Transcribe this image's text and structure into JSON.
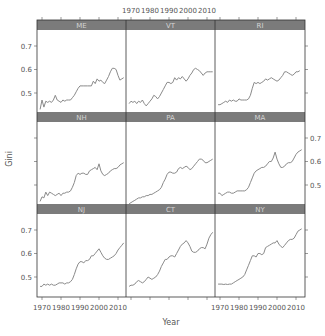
{
  "chart_data": {
    "type": "line",
    "layout": "trellis 3x3",
    "title": "",
    "xlabel": "Year",
    "ylabel": "Gini",
    "xlim": [
      1967,
      2014
    ],
    "ylim": [
      0.415,
      0.765
    ],
    "x_ticks": [
      1970,
      1980,
      1990,
      2000,
      2010
    ],
    "y_ticks": [
      0.5,
      0.6,
      0.7
    ],
    "grid": false,
    "legend": null,
    "colors": {
      "strip_bg": "#7b7b7b",
      "strip_text": "#d4d4d4",
      "line": "#8a8a8a",
      "frame": "#333333",
      "axis_text": "#555555"
    },
    "panels": [
      {
        "name": "ME",
        "row": 0,
        "col": 0,
        "x": [
          1969,
          1970,
          1971,
          1972,
          1973,
          1974,
          1975,
          1976,
          1977,
          1978,
          1979,
          1980,
          1981,
          1982,
          1983,
          1984,
          1985,
          1986,
          1987,
          1988,
          1989,
          1990,
          1992,
          1994,
          1996,
          1997,
          1998,
          1999,
          2000,
          2001,
          2002,
          2003,
          2004,
          2005,
          2006,
          2007,
          2008,
          2009,
          2010,
          2011,
          2012,
          2013
        ],
        "y": [
          0.43,
          0.47,
          0.44,
          0.465,
          0.46,
          0.465,
          0.46,
          0.47,
          0.49,
          0.47,
          0.465,
          0.46,
          0.47,
          0.465,
          0.47,
          0.47,
          0.47,
          0.48,
          0.49,
          0.505,
          0.52,
          0.53,
          0.53,
          0.53,
          0.53,
          0.55,
          0.54,
          0.56,
          0.55,
          0.555,
          0.545,
          0.54,
          0.555,
          0.57,
          0.59,
          0.605,
          0.605,
          0.6,
          0.575,
          0.555,
          0.56,
          0.565
        ]
      },
      {
        "name": "VT",
        "row": 0,
        "col": 1,
        "x": [
          1969,
          1970,
          1971,
          1972,
          1973,
          1974,
          1975,
          1976,
          1977,
          1978,
          1979,
          1980,
          1981,
          1982,
          1983,
          1984,
          1985,
          1986,
          1987,
          1988,
          1989,
          1990,
          1991,
          1992,
          1993,
          1994,
          1995,
          1996,
          1997,
          1998,
          1999,
          2000,
          2001,
          2002,
          2003,
          2004,
          2005,
          2006,
          2007,
          2008,
          2009,
          2010,
          2011,
          2012,
          2013
        ],
        "y": [
          0.455,
          0.465,
          0.46,
          0.465,
          0.455,
          0.465,
          0.46,
          0.47,
          0.455,
          0.445,
          0.455,
          0.465,
          0.475,
          0.49,
          0.485,
          0.475,
          0.485,
          0.5,
          0.515,
          0.53,
          0.545,
          0.545,
          0.54,
          0.545,
          0.565,
          0.555,
          0.565,
          0.56,
          0.57,
          0.56,
          0.55,
          0.56,
          0.575,
          0.585,
          0.6,
          0.605,
          0.6,
          0.595,
          0.585,
          0.575,
          0.585,
          0.59,
          0.59,
          0.59,
          0.59
        ]
      },
      {
        "name": "RI",
        "row": 0,
        "col": 2,
        "x": [
          1969,
          1970,
          1971,
          1972,
          1973,
          1974,
          1975,
          1976,
          1977,
          1978,
          1979,
          1980,
          1981,
          1982,
          1983,
          1984,
          1985,
          1986,
          1987,
          1988,
          1989,
          1990,
          1991,
          1992,
          1993,
          1994,
          1995,
          1996,
          1997,
          1998,
          1999,
          2000,
          2001,
          2002,
          2003,
          2004,
          2005,
          2006,
          2007,
          2008,
          2009,
          2010,
          2011,
          2012
        ],
        "y": [
          0.45,
          0.45,
          0.455,
          0.46,
          0.465,
          0.46,
          0.47,
          0.465,
          0.47,
          0.465,
          0.465,
          0.475,
          0.47,
          0.47,
          0.47,
          0.47,
          0.475,
          0.49,
          0.52,
          0.545,
          0.54,
          0.545,
          0.54,
          0.545,
          0.55,
          0.56,
          0.555,
          0.56,
          0.565,
          0.56,
          0.555,
          0.55,
          0.555,
          0.565,
          0.575,
          0.59,
          0.59,
          0.585,
          0.58,
          0.575,
          0.58,
          0.59,
          0.59,
          0.595
        ]
      },
      {
        "name": "NH",
        "row": 1,
        "col": 0,
        "x": [
          1969,
          1970,
          1971,
          1972,
          1973,
          1974,
          1975,
          1976,
          1977,
          1978,
          1979,
          1980,
          1981,
          1982,
          1983,
          1984,
          1985,
          1986,
          1987,
          1988,
          1989,
          1990,
          1991,
          1992,
          1993,
          1994,
          1995,
          1996,
          1997,
          1998,
          1999,
          2000,
          2001,
          2002,
          2003,
          2004,
          2005,
          2006,
          2007,
          2008,
          2009,
          2010,
          2011,
          2012,
          2013
        ],
        "y": [
          0.43,
          0.45,
          0.445,
          0.47,
          0.455,
          0.47,
          0.465,
          0.46,
          0.455,
          0.46,
          0.465,
          0.455,
          0.465,
          0.465,
          0.47,
          0.47,
          0.475,
          0.49,
          0.51,
          0.54,
          0.55,
          0.545,
          0.55,
          0.55,
          0.545,
          0.545,
          0.56,
          0.565,
          0.57,
          0.575,
          0.565,
          0.59,
          0.56,
          0.545,
          0.54,
          0.545,
          0.55,
          0.56,
          0.565,
          0.57,
          0.57,
          0.575,
          0.585,
          0.59,
          0.595
        ]
      },
      {
        "name": "PA",
        "row": 1,
        "col": 1,
        "x": [
          1969,
          1970,
          1971,
          1972,
          1973,
          1974,
          1975,
          1976,
          1977,
          1978,
          1979,
          1980,
          1981,
          1982,
          1983,
          1984,
          1985,
          1986,
          1987,
          1988,
          1989,
          1990,
          1991,
          1992,
          1993,
          1994,
          1995,
          1996,
          1997,
          1998,
          1999,
          2000,
          2001,
          2002,
          2003,
          2004,
          2005,
          2006,
          2007,
          2008,
          2009,
          2010,
          2011,
          2012,
          2013
        ],
        "y": [
          0.42,
          0.425,
          0.43,
          0.435,
          0.44,
          0.445,
          0.445,
          0.45,
          0.45,
          0.455,
          0.455,
          0.46,
          0.46,
          0.465,
          0.47,
          0.475,
          0.48,
          0.49,
          0.51,
          0.525,
          0.545,
          0.555,
          0.555,
          0.55,
          0.55,
          0.555,
          0.57,
          0.575,
          0.57,
          0.575,
          0.58,
          0.575,
          0.565,
          0.57,
          0.58,
          0.59,
          0.6,
          0.61,
          0.61,
          0.605,
          0.595,
          0.595,
          0.6,
          0.605,
          0.61
        ]
      },
      {
        "name": "MA",
        "row": 1,
        "col": 2,
        "x": [
          1969,
          1970,
          1971,
          1972,
          1973,
          1974,
          1975,
          1976,
          1977,
          1978,
          1979,
          1980,
          1981,
          1982,
          1983,
          1984,
          1985,
          1986,
          1987,
          1988,
          1989,
          1990,
          1991,
          1992,
          1993,
          1994,
          1995,
          1996,
          1997,
          1998,
          1999,
          2000,
          2001,
          2002,
          2003,
          2004,
          2005,
          2006,
          2007,
          2008,
          2009,
          2010,
          2011,
          2012,
          2013
        ],
        "y": [
          0.465,
          0.465,
          0.455,
          0.46,
          0.465,
          0.47,
          0.47,
          0.465,
          0.465,
          0.47,
          0.475,
          0.475,
          0.475,
          0.475,
          0.475,
          0.48,
          0.49,
          0.51,
          0.53,
          0.55,
          0.56,
          0.565,
          0.57,
          0.575,
          0.575,
          0.58,
          0.59,
          0.6,
          0.6,
          0.615,
          0.64,
          0.61,
          0.59,
          0.575,
          0.575,
          0.58,
          0.59,
          0.595,
          0.595,
          0.6,
          0.615,
          0.63,
          0.64,
          0.645,
          0.65
        ]
      },
      {
        "name": "NJ",
        "row": 2,
        "col": 0,
        "x": [
          1969,
          1970,
          1971,
          1972,
          1973,
          1974,
          1975,
          1976,
          1977,
          1978,
          1979,
          1980,
          1981,
          1982,
          1983,
          1984,
          1985,
          1986,
          1987,
          1988,
          1989,
          1990,
          1991,
          1992,
          1993,
          1994,
          1995,
          1996,
          1997,
          1998,
          1999,
          2000,
          2001,
          2002,
          2003,
          2004,
          2005,
          2006,
          2007,
          2008,
          2009,
          2010,
          2011,
          2012,
          2013
        ],
        "y": [
          0.46,
          0.46,
          0.47,
          0.465,
          0.47,
          0.465,
          0.47,
          0.465,
          0.465,
          0.47,
          0.475,
          0.475,
          0.475,
          0.47,
          0.475,
          0.475,
          0.48,
          0.49,
          0.51,
          0.535,
          0.555,
          0.565,
          0.565,
          0.56,
          0.57,
          0.57,
          0.575,
          0.59,
          0.59,
          0.6,
          0.61,
          0.62,
          0.605,
          0.59,
          0.58,
          0.575,
          0.575,
          0.58,
          0.585,
          0.59,
          0.6,
          0.615,
          0.625,
          0.635,
          0.645
        ]
      },
      {
        "name": "CT",
        "row": 2,
        "col": 1,
        "x": [
          1969,
          1970,
          1971,
          1972,
          1973,
          1974,
          1975,
          1976,
          1977,
          1978,
          1979,
          1980,
          1981,
          1982,
          1983,
          1984,
          1985,
          1986,
          1987,
          1988,
          1989,
          1990,
          1991,
          1992,
          1993,
          1994,
          1995,
          1996,
          1997,
          1998,
          1999,
          2000,
          2001,
          2002,
          2003,
          2004,
          2005,
          2006,
          2007,
          2008,
          2009,
          2010,
          2011,
          2012,
          2013
        ],
        "y": [
          0.46,
          0.465,
          0.465,
          0.47,
          0.48,
          0.485,
          0.48,
          0.475,
          0.48,
          0.49,
          0.5,
          0.495,
          0.49,
          0.495,
          0.5,
          0.51,
          0.525,
          0.545,
          0.56,
          0.575,
          0.575,
          0.585,
          0.59,
          0.59,
          0.585,
          0.6,
          0.615,
          0.63,
          0.64,
          0.645,
          0.655,
          0.645,
          0.63,
          0.61,
          0.605,
          0.605,
          0.61,
          0.62,
          0.625,
          0.625,
          0.62,
          0.64,
          0.665,
          0.68,
          0.69
        ]
      },
      {
        "name": "NY",
        "row": 2,
        "col": 2,
        "x": [
          1969,
          1970,
          1971,
          1972,
          1973,
          1974,
          1975,
          1976,
          1977,
          1978,
          1979,
          1980,
          1981,
          1982,
          1983,
          1984,
          1985,
          1986,
          1987,
          1988,
          1989,
          1990,
          1991,
          1992,
          1993,
          1994,
          1995,
          1996,
          1997,
          1998,
          1999,
          2000,
          2001,
          2002,
          2003,
          2004,
          2005,
          2006,
          2007,
          2008,
          2009,
          2010,
          2011,
          2012,
          2013
        ],
        "y": [
          0.47,
          0.47,
          0.47,
          0.468,
          0.47,
          0.468,
          0.47,
          0.47,
          0.475,
          0.48,
          0.485,
          0.49,
          0.495,
          0.5,
          0.51,
          0.53,
          0.55,
          0.57,
          0.59,
          0.59,
          0.585,
          0.6,
          0.6,
          0.595,
          0.6,
          0.625,
          0.63,
          0.635,
          0.64,
          0.645,
          0.645,
          0.655,
          0.64,
          0.63,
          0.625,
          0.635,
          0.645,
          0.655,
          0.66,
          0.66,
          0.665,
          0.68,
          0.695,
          0.7,
          0.705
        ]
      }
    ]
  }
}
